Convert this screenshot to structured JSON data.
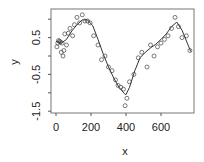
{
  "chart_data": {
    "type": "scatter",
    "title": "",
    "xlabel": "x",
    "ylabel": "y",
    "xlim": [
      -30,
      790
    ],
    "ylim": [
      -1.55,
      1.25
    ],
    "x_ticks": [
      0,
      200,
      400,
      600
    ],
    "x_tick_labels": [
      "0",
      "200",
      "400",
      "600"
    ],
    "y_ticks": [
      1.0,
      0.5,
      0.0,
      -0.5,
      -1.0,
      -1.5
    ],
    "y_tick_labels": [
      "",
      "0.5",
      "",
      "-0.5",
      "",
      "-1.5"
    ],
    "grid": false,
    "legend": null,
    "series": [
      {
        "name": "observations",
        "kind": "points",
        "marker": "open-circle",
        "x": [
          5,
          10,
          15,
          20,
          25,
          30,
          35,
          40,
          45,
          50,
          60,
          70,
          80,
          95,
          105,
          120,
          135,
          150,
          165,
          180,
          195,
          215,
          240,
          260,
          280,
          300,
          320,
          340,
          355,
          370,
          385,
          395,
          405,
          420,
          445,
          470,
          490,
          520,
          540,
          560,
          580,
          600,
          620,
          640,
          660,
          680,
          700,
          720,
          745,
          765
        ],
        "y": [
          0.25,
          0.35,
          0.42,
          0.4,
          0.38,
          0.1,
          0.35,
          0.0,
          0.15,
          0.6,
          0.3,
          0.62,
          0.75,
          0.55,
          0.85,
          1.05,
          0.9,
          1.12,
          0.95,
          0.95,
          0.9,
          0.55,
          0.3,
          -0.1,
          0.0,
          -0.3,
          -0.4,
          -0.65,
          -0.8,
          -0.85,
          -0.9,
          -1.35,
          -1.15,
          -0.7,
          -0.5,
          -0.05,
          0.1,
          -0.3,
          0.3,
          0.0,
          0.25,
          0.35,
          0.45,
          0.55,
          0.75,
          1.05,
          0.8,
          0.5,
          0.55,
          0.15
        ]
      },
      {
        "name": "smooth fit",
        "kind": "line",
        "x": [
          0,
          30,
          60,
          90,
          120,
          150,
          180,
          210,
          240,
          270,
          300,
          330,
          360,
          390,
          400,
          420,
          450,
          480,
          510,
          540,
          570,
          600,
          630,
          660,
          690,
          720,
          750,
          770
        ],
        "y": [
          0.4,
          0.35,
          0.45,
          0.68,
          0.85,
          0.98,
          0.98,
          0.82,
          0.45,
          0.05,
          -0.3,
          -0.6,
          -0.85,
          -1.02,
          -1.05,
          -0.85,
          -0.4,
          -0.05,
          0.1,
          0.22,
          0.32,
          0.45,
          0.6,
          0.8,
          0.92,
          0.7,
          0.35,
          0.12
        ]
      }
    ],
    "colors": {
      "points": "#444444",
      "line": "#333333",
      "axes": "#555555",
      "text": "#222222"
    }
  }
}
